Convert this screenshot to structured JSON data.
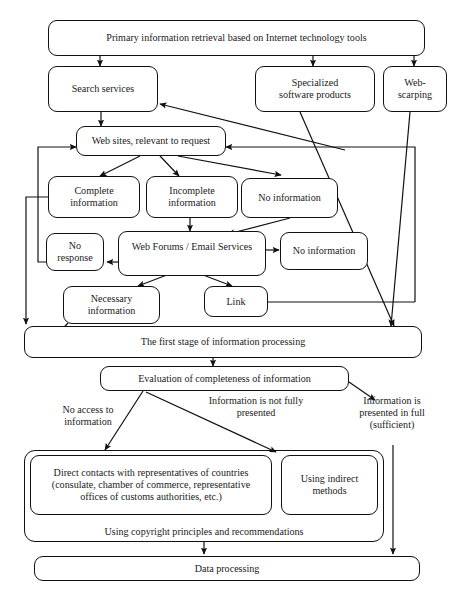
{
  "diagram": {
    "nodes": {
      "primary_retrieval": "Primary information retrieval based on Internet technology tools",
      "search_services": "Search services",
      "specialized_software": "Specialized\nsoftware products",
      "web_scarping": "Web-\nscarping",
      "web_sites": "Web sites, relevant to request",
      "complete_information": "Complete\ninformation",
      "incomplete_information": "Incomplete\ninformation",
      "no_information_top": "No information",
      "no_response": "No\nresponse",
      "web_forums": "Web Forums / Email Services",
      "no_information_mid": "No information",
      "necessary_information": "Necessary\ninformation",
      "link": "Link",
      "first_stage": "The first stage of information processing",
      "evaluation": "Evaluation of completeness of information",
      "direct_contacts": "Direct contacts with representatives of countries\n(consulate, chamber of commerce, representative\noffices of customs authorities, etc.)",
      "indirect_methods": "Using indirect\nmethods",
      "copyright_principles": "Using copyright principles and recommendations",
      "data_processing": "Data processing"
    },
    "edge_labels": {
      "no_access": "No access to\ninformation",
      "not_fully_presented": "Information is not fully\npresented",
      "presented_in_full": "Information is\npresented in full\n(sufficient)"
    },
    "style": {
      "stroke": "#111111",
      "background": "#ffffff",
      "line_width": "1.2"
    }
  }
}
